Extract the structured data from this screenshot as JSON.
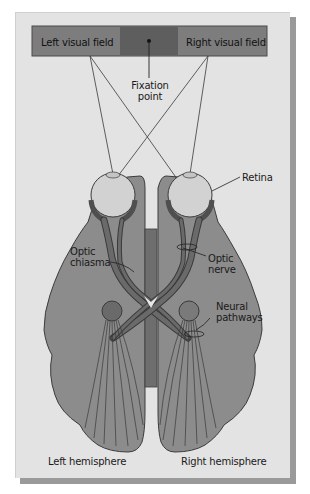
{
  "figure": {
    "colors": {
      "background": "#e3e3e3",
      "visual_field_outer": "#7d7d7d",
      "visual_field_center": "#5e5e5e",
      "brain": "#8c8c8c",
      "nerve": "#5f5f5f",
      "eye": "#d2d2d2",
      "midline": "#6e6e6e"
    }
  },
  "labels": {
    "left_visual_field": "Left visual field",
    "right_visual_field": "Right visual field",
    "fixation_point_line1": "Fixation",
    "fixation_point_line2": "point",
    "retina": "Retina",
    "optic_chiasma_line1": "Optic",
    "optic_chiasma_line2": "chiasma",
    "optic_nerve_line1": "Optic",
    "optic_nerve_line2": "nerve",
    "neural_pathways_line1": "Neural",
    "neural_pathways_line2": "pathways",
    "left_hemisphere": "Left hemisphere",
    "right_hemisphere": "Right hemisphere"
  }
}
